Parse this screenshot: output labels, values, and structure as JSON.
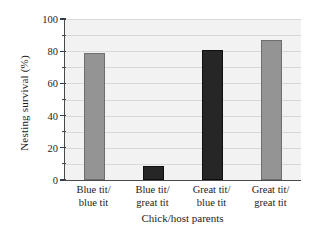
{
  "chart_data": {
    "type": "bar",
    "title": "",
    "xlabel": "Chick/host parents",
    "ylabel": "Nesting survival (%)",
    "categories": [
      "Blue tit/ blue tit",
      "Blue tit/ great tit",
      "Great tit/ blue tit",
      "Great tit/ great tit"
    ],
    "category_lines": [
      [
        "Blue tit/",
        "blue tit"
      ],
      [
        "Blue tit/",
        "great tit"
      ],
      [
        "Great tit/",
        "blue tit"
      ],
      [
        "Great tit/",
        "great tit"
      ]
    ],
    "values": [
      79,
      9,
      81,
      87
    ],
    "bar_colors": [
      "#949494",
      "#262626",
      "#262626",
      "#949494"
    ],
    "ylim": [
      0,
      100
    ],
    "ytick_labels": [
      "0",
      "20",
      "40",
      "60",
      "80",
      "100"
    ],
    "ytick_values": [
      0,
      20,
      40,
      60,
      80,
      100
    ],
    "yminor_values": [
      10,
      30,
      50,
      70,
      90
    ],
    "gridlines": [
      10,
      20,
      30,
      40,
      50,
      60,
      70,
      80,
      90,
      100
    ],
    "grid": true,
    "legend": "none",
    "plot_background": "#f2f2f2",
    "axis_color": "#4a4a4a"
  }
}
